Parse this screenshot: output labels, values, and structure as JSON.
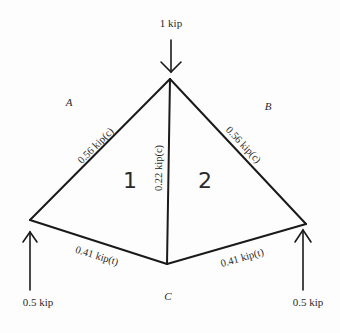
{
  "diagram": {
    "type": "truss-free-body-diagram",
    "applied_load": {
      "label": "1 kip",
      "direction": "down",
      "at": "top-joint"
    },
    "reactions": [
      {
        "label": "0.5 kip",
        "direction": "up",
        "at": "left-joint"
      },
      {
        "label": "0.5 kip",
        "direction": "up",
        "at": "right-joint"
      }
    ],
    "regions": {
      "a": "A",
      "b": "B",
      "c": "C",
      "panel_1": "1",
      "panel_2": "2"
    },
    "members": {
      "top_left": "0.56 kip(c)",
      "top_right": "0.56 kip(c)",
      "vertical": "0.22 kip(c)",
      "bottom_left": "0.41 kip(t)",
      "bottom_right": "0.41 kip(t)"
    },
    "line_color": "#1a1a1a"
  }
}
